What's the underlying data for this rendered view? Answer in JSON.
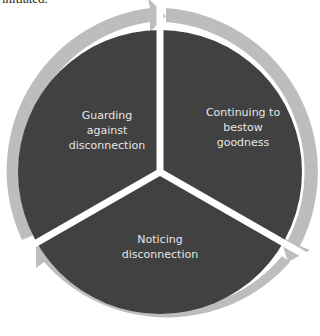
{
  "header": {
    "clipped_text": "initiated."
  },
  "diagram": {
    "type": "cycle",
    "direction": "clockwise",
    "colors": {
      "sector_fill": "#414141",
      "ring_arrow": "#bdbdbd",
      "separator": "#ffffff",
      "label_text": "#e6e6e6"
    },
    "stages": [
      {
        "id": "continuing",
        "lines": [
          "Continuing to",
          "bestow",
          "goodness"
        ]
      },
      {
        "id": "noticing",
        "lines": [
          "Noticing",
          "disconnection"
        ]
      },
      {
        "id": "guarding",
        "lines": [
          "Guarding",
          "against",
          "disconnection"
        ]
      }
    ]
  }
}
